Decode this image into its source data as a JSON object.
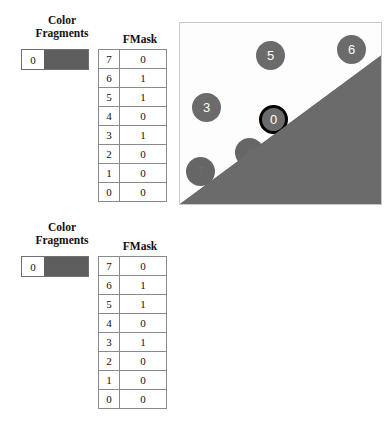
{
  "figure": {
    "panels": [
      {
        "id": "top",
        "legend": {
          "color_fragments_label_line1": "Color",
          "color_fragments_label_line2": "Fragments",
          "fmask_label": "FMask",
          "fragment_index": "0"
        },
        "fmask_rows": [
          {
            "index": "7",
            "value": "0"
          },
          {
            "index": "6",
            "value": "1"
          },
          {
            "index": "5",
            "value": "1"
          },
          {
            "index": "4",
            "value": "0"
          },
          {
            "index": "3",
            "value": "1"
          },
          {
            "index": "2",
            "value": "0"
          },
          {
            "index": "1",
            "value": "0"
          },
          {
            "index": "0",
            "value": "0"
          }
        ],
        "samples": [
          {
            "label": "3",
            "state": "visible"
          },
          {
            "label": "5",
            "state": "visible"
          },
          {
            "label": "6",
            "state": "visible"
          },
          {
            "label": "0",
            "state": "center-occluded"
          },
          {
            "label": "1",
            "state": "covered"
          },
          {
            "label": "2",
            "state": "covered"
          },
          {
            "label": "4",
            "state": "covered"
          },
          {
            "label": "7",
            "state": "covered"
          }
        ]
      },
      {
        "id": "bottom",
        "legend": {
          "color_fragments_label_line1": "Color",
          "color_fragments_label_line2": "Fragments",
          "fmask_label": "FMask",
          "fragment_index": "0"
        },
        "fmask_rows": [
          {
            "index": "7",
            "value": "0"
          },
          {
            "index": "6",
            "value": "1"
          },
          {
            "index": "5",
            "value": "1"
          },
          {
            "index": "4",
            "value": "0"
          },
          {
            "index": "3",
            "value": "1"
          },
          {
            "index": "2",
            "value": "0"
          },
          {
            "index": "1",
            "value": "0"
          },
          {
            "index": "0",
            "value": "0"
          }
        ],
        "samples": [
          {
            "label": "3",
            "state": "faded"
          },
          {
            "label": "5",
            "state": "faded"
          },
          {
            "label": "6",
            "state": "faded"
          },
          {
            "label": "0",
            "state": "center"
          },
          {
            "label": "1",
            "state": "visible"
          },
          {
            "label": "2",
            "state": "visible"
          },
          {
            "label": "4",
            "state": "visible"
          },
          {
            "label": "7",
            "state": "visible"
          }
        ]
      }
    ]
  },
  "colors": {
    "fragment_fill": "#5e5e5e",
    "sample_dot": "#6b6b6b",
    "dark_triangle": "#6b6b6b",
    "light_triangle": "#dcdcdc",
    "center_ring": "#000000",
    "viewport_border": "#c9c9c9",
    "table_border": "#8a8a8a"
  }
}
